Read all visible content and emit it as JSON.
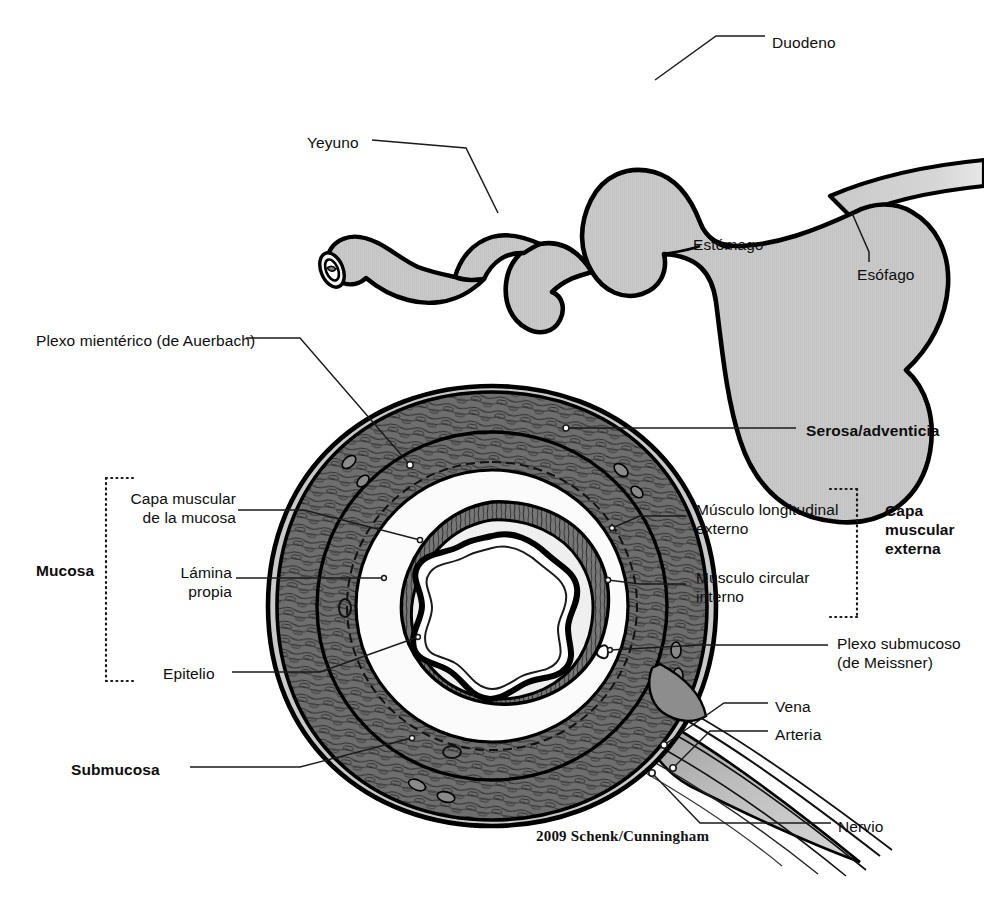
{
  "figure": {
    "credit": "2009 Schenk/Cunningham",
    "colors": {
      "outline": "#000000",
      "organ_fill": "#c9c9c9",
      "serosa_fill": "#c9c9c9",
      "muscle_fill": "#6e6e6e",
      "muscle_dark": "#5a5a5a",
      "submucosa_fill": "#f2f2f2",
      "lumen_fill": "#ffffff",
      "leader_line": "#1a1a1a",
      "bracket": "#1a1a1a",
      "background": "#ffffff"
    }
  },
  "upper_diagram": {
    "name": "stomach-overview",
    "labels": [
      {
        "id": "duodeno",
        "text": "Duodeno",
        "x": 772,
        "y": 33,
        "anchor": "left"
      },
      {
        "id": "yeyuno",
        "text": "Yeyuno",
        "x": 307,
        "y": 133,
        "anchor": "left"
      },
      {
        "id": "estomago",
        "text": "Estómago",
        "x": 693,
        "y": 235,
        "anchor": "left"
      },
      {
        "id": "esofago",
        "text": "Esófago",
        "x": 857,
        "y": 265,
        "anchor": "left"
      }
    ]
  },
  "lower_diagram": {
    "name": "gi-tract-cross-section",
    "left_labels": [
      {
        "id": "plexo-mienterico",
        "lines": [
          "Plexo mientérico (de Auerbach)"
        ],
        "x": 36,
        "y": 331
      },
      {
        "id": "capa-muscular-mucosa",
        "lines": [
          "Capa muscular",
          "de la mucosa"
        ],
        "x": 112,
        "y": 489
      },
      {
        "id": "lamina-propia",
        "lines": [
          "Lámina",
          "propia"
        ],
        "x": 168,
        "y": 563
      },
      {
        "id": "epitelio",
        "lines": [
          "Epitelio"
        ],
        "x": 163,
        "y": 664
      },
      {
        "id": "mucosa",
        "lines": [
          "Mucosa"
        ],
        "x": 36,
        "y": 561,
        "bold": true
      },
      {
        "id": "submucosa",
        "lines": [
          "Submucosa"
        ],
        "x": 71,
        "y": 760,
        "bold": true
      }
    ],
    "right_labels": [
      {
        "id": "serosa-adventicia",
        "lines": [
          "Serosa/adventicia"
        ],
        "x": 806,
        "y": 421,
        "bold": true
      },
      {
        "id": "musculo-longitudinal",
        "lines": [
          "Músculo longitudinal",
          "externo"
        ],
        "x": 696,
        "y": 500
      },
      {
        "id": "musculo-circular",
        "lines": [
          "Músculo circular",
          "interno"
        ],
        "x": 696,
        "y": 568
      },
      {
        "id": "capa-muscular-externa",
        "lines": [
          "Capa",
          "muscular",
          "externa"
        ],
        "x": 885,
        "y": 501,
        "bold": true
      },
      {
        "id": "plexo-submucoso",
        "lines": [
          "Plexo submucoso",
          "(de Meissner)"
        ],
        "x": 837,
        "y": 634
      },
      {
        "id": "vena",
        "lines": [
          "Vena"
        ],
        "x": 775,
        "y": 697
      },
      {
        "id": "arteria",
        "lines": [
          "Arteria"
        ],
        "x": 775,
        "y": 725
      },
      {
        "id": "nervio",
        "lines": [
          "Nervio"
        ],
        "x": 838,
        "y": 817
      }
    ],
    "brackets": [
      {
        "id": "mucosa-bracket",
        "side": "left",
        "x": 106,
        "top": 478,
        "bottom": 681
      },
      {
        "id": "capa-muscular-externa-bracket",
        "side": "right",
        "x": 857,
        "top": 489,
        "bottom": 617
      }
    ]
  }
}
